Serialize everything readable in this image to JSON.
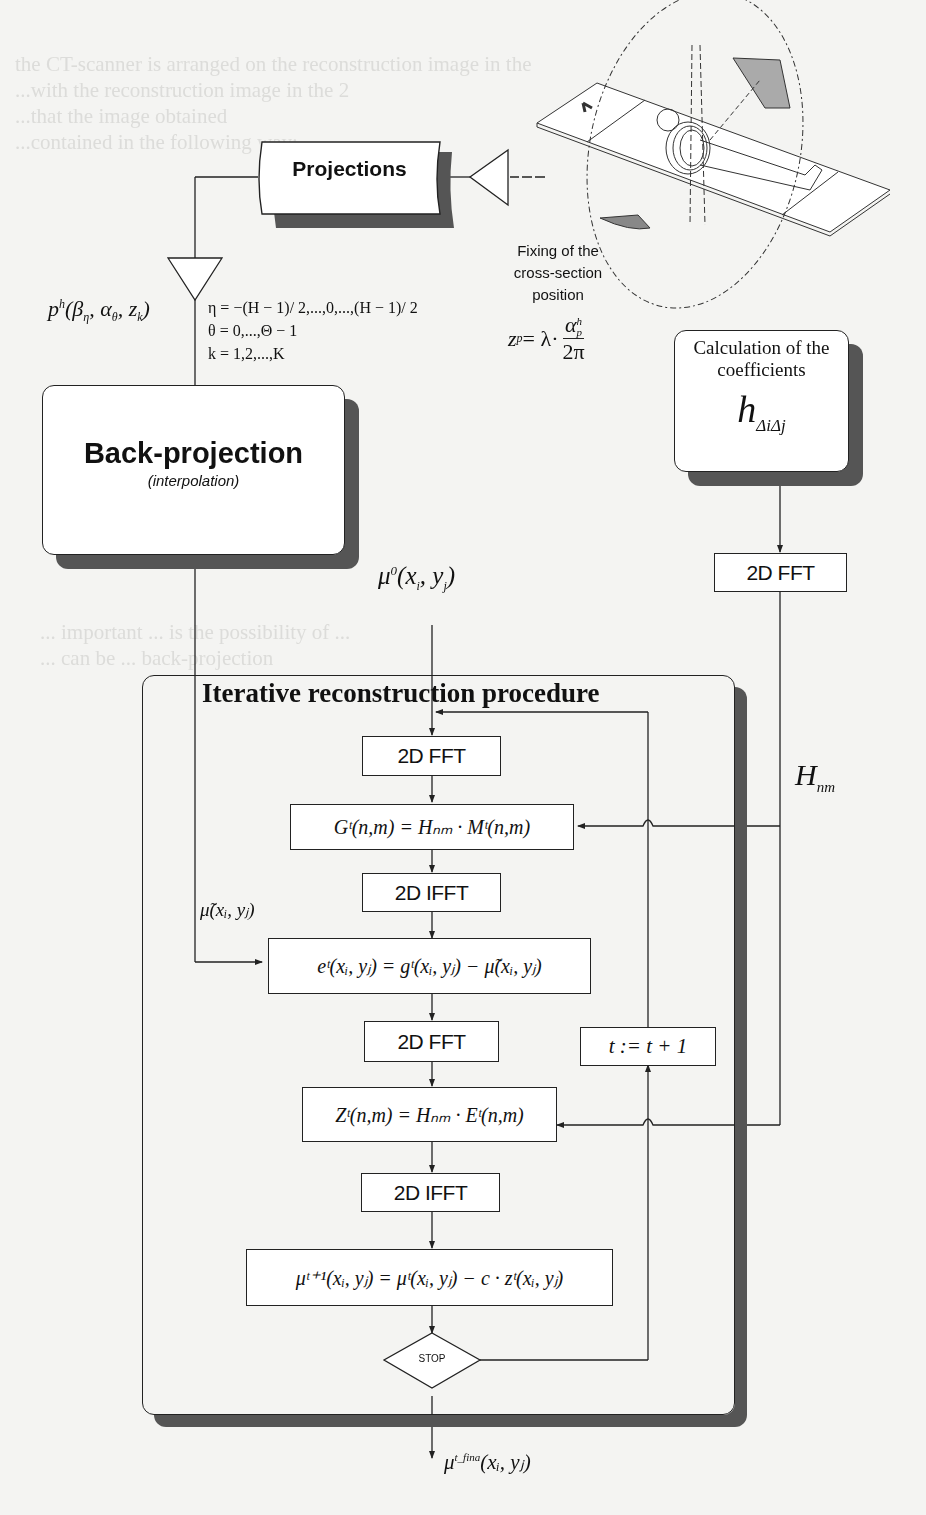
{
  "diagram": {
    "type": "flowchart",
    "nodes": {
      "projections": {
        "label": "Projections"
      },
      "scanner_caption": {
        "line1": "Fixing of the",
        "line2": "cross-section",
        "line3": "position"
      },
      "z_formula": {
        "lhs": "z",
        "lhs_sub": "p",
        "eq": " = λ·",
        "num": "α",
        "num_sup": "h",
        "num_sub": "p",
        "den": "2π"
      },
      "projection_data": {
        "text": "p",
        "sup": "h",
        "args": "(β",
        "args_tail": ", α",
        "args_tail2": ", z",
        "close": ")",
        "sub1": "η",
        "sub2": "θ",
        "sub3": "k"
      },
      "index_ranges": {
        "eta": "η = −(H − 1)/ 2,...,0,...,(H − 1)/ 2",
        "theta": "θ = 0,...,Θ − 1",
        "k": "k = 1,2,...,K"
      },
      "back_projection": {
        "title": "Back-projection",
        "subtitle": "(interpolation)"
      },
      "coefficients": {
        "line1": "Calculation of the",
        "line2": "coefficients",
        "symbol": "h",
        "symbol_sub": "ΔiΔj"
      },
      "fft_coeffs": {
        "label": "2D FFT"
      },
      "H_nm": {
        "symbol": "H",
        "sub": "nm"
      },
      "mu0": {
        "text": "μ",
        "sup": "0",
        "args": "(x",
        "sub_i": "i",
        "mid": ", y",
        "sub_j": "j",
        "close": ")"
      },
      "iterative_box": {
        "title": "Iterative reconstruction procedure"
      },
      "fft1": {
        "label": "2D FFT"
      },
      "G_eq": {
        "text": "Gᵗ(n,m) = Hₙₘ · Mᵗ(n,m)"
      },
      "ifft1": {
        "label": "2D IFFT"
      },
      "mu_tilde": {
        "text": "μ̃(xᵢ, yⱼ)"
      },
      "e_eq": {
        "text": "eᵗ(xᵢ, yⱼ) = gᵗ(xᵢ, yⱼ) − μ̃(xᵢ, yⱼ)"
      },
      "fft2": {
        "label": "2D FFT"
      },
      "t_update": {
        "text": "t := t + 1"
      },
      "Z_eq": {
        "text": "Zᵗ(n,m) = Hₙₘ · Eᵗ(n,m)"
      },
      "ifft2": {
        "label": "2D IFFT"
      },
      "mu_update": {
        "text": "μᵗ⁺¹(xᵢ, yⱼ) = μᵗ(xᵢ, yⱼ) − c · zᵗ(xᵢ, yⱼ)"
      },
      "stop": {
        "label": "STOP"
      },
      "mu_final": {
        "text": "μ",
        "sup": "t_fina",
        "args": "(xᵢ, yⱼ)"
      }
    },
    "colors": {
      "line": "#222222",
      "shadow": "#555555",
      "background": "#f4f4f2",
      "box_fill": "#ffffff"
    }
  },
  "background_text": {
    "lines": [
      "the CT-scanner is arranged on the reconstruction image in the",
      "...with the reconstruction image in the 2",
      "...that the image obtained",
      "...contained in the following way:",
      "",
      "",
      "",
      "",
      "... reconstruction image ... ,",
      "... consider the ... obtained ...",
      "...projections ... ",
      "... ... ",
      "",
      "",
      "",
      "",
      "",
      "... important ... is the possibility of ... ",
      "... can be ... back-projection",
      "... ... in ... ",
      "... ... ",
      "... presented in ... the",
      "... applied ... ",
      "... ... ",
      "... ... ",
      "... ... ",
      "... ... "
    ]
  }
}
